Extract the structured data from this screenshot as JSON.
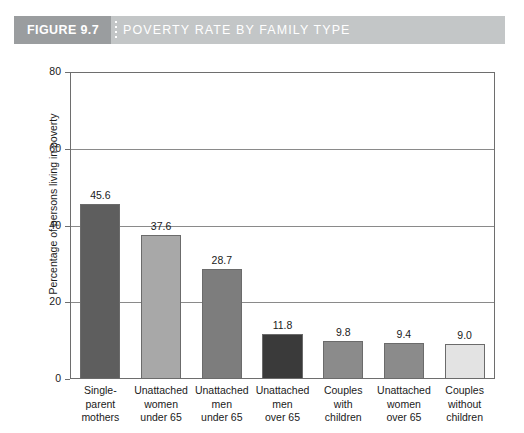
{
  "header": {
    "badge": "FIGURE 9.7",
    "title": "POVERTY RATE BY FAMILY TYPE",
    "badge_color": "#9a9d9f",
    "bar_color": "#c3c6c7",
    "text_color": "#ffffff"
  },
  "chart_data": {
    "type": "bar",
    "title": "POVERTY RATE BY FAMILY TYPE",
    "xlabel": "",
    "ylabel": "Percentage of persons living in poverty",
    "ylim": [
      0,
      80
    ],
    "yticks": [
      0,
      20,
      40,
      60,
      80
    ],
    "ytick_labels": [
      "0",
      "20",
      "40",
      "60",
      "80"
    ],
    "grid": "horizontal",
    "legend": "none",
    "categories": [
      "Single-parent mothers",
      "Unattached women under 65",
      "Unattached men under 65",
      "Unattached men over 65",
      "Couples with children",
      "Unattached women over 65",
      "Couples without children"
    ],
    "category_lines": [
      [
        "Single-",
        "parent",
        "mothers"
      ],
      [
        "Unattached",
        "women",
        "under 65"
      ],
      [
        "Unattached",
        "men",
        "under 65"
      ],
      [
        "Unattached",
        "men",
        "over 65"
      ],
      [
        "Couples",
        "with",
        "children"
      ],
      [
        "Unattached",
        "women",
        "over 65"
      ],
      [
        "Couples",
        "without",
        "children"
      ]
    ],
    "values": [
      45.6,
      37.6,
      28.7,
      11.8,
      9.8,
      9.4,
      9.0
    ],
    "value_labels": [
      "45.6",
      "37.6",
      "28.7",
      "11.8",
      "9.8",
      "9.4",
      "9.0"
    ],
    "bar_colors": [
      "#5e5e5e",
      "#a8a8a8",
      "#7d7d7d",
      "#3a3a3a",
      "#8b8b8b",
      "#8b8b8b",
      "#e3e3e3"
    ]
  }
}
